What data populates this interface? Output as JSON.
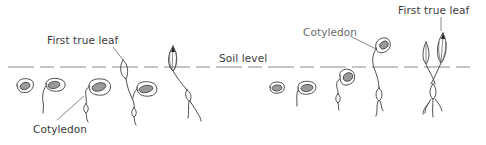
{
  "diagram": {
    "labels": {
      "left_first_true_leaf": "First true leaf",
      "left_cotyledon": "Cotyledon",
      "soil_level": "Soil level",
      "right_cotyledon": "Cotyledon",
      "right_first_true_leaf": "First true leaf"
    },
    "sequences": [
      {
        "name": "left",
        "stages": 5
      },
      {
        "name": "right",
        "stages": 5
      }
    ],
    "colors": {
      "line": "#3c3c3c",
      "seed_fill": "#9a9a9a",
      "soil_line": "#8a8a8a",
      "background": "#ffffff"
    }
  }
}
